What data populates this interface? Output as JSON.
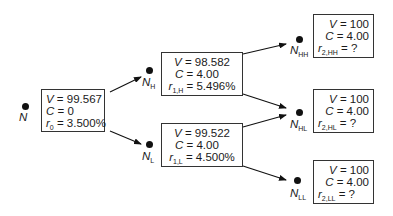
{
  "diagram": {
    "type": "binomial interest rate tree",
    "nodes": {
      "root": {
        "label": "N",
        "sub": "",
        "V": "99.567",
        "C": "0",
        "r_sym": "r",
        "r_sub": "0",
        "r": "3.500%"
      },
      "H": {
        "label": "N",
        "sub": "H",
        "V": "98.582",
        "C": "4.00",
        "r_sym": "r",
        "r_sub": "1,H",
        "r": "5.496%"
      },
      "L": {
        "label": "N",
        "sub": "L",
        "V": "99.522",
        "C": "4.00",
        "r_sym": "r",
        "r_sub": "1,L",
        "r": "4.500%"
      },
      "HH": {
        "label": "N",
        "sub": "HH",
        "V": "100",
        "C": "4.00",
        "r_sym": "r",
        "r_sub": "2,HH",
        "r": "?"
      },
      "HL": {
        "label": "N",
        "sub": "HL",
        "V": "100",
        "C": "4.00",
        "r_sym": "r",
        "r_sub": "2,HL",
        "r": "?"
      },
      "LL": {
        "label": "N",
        "sub": "LL",
        "V": "100",
        "C": "4.00",
        "r_sym": "r",
        "r_sub": "2,LL",
        "r": "?"
      }
    },
    "symbols": {
      "V": "V",
      "C": "C",
      "eq": " = "
    },
    "edges": [
      {
        "from": "root",
        "to": "H"
      },
      {
        "from": "root",
        "to": "L"
      },
      {
        "from": "H",
        "to": "HH"
      },
      {
        "from": "H",
        "to": "HL"
      },
      {
        "from": "L",
        "to": "HL"
      },
      {
        "from": "L",
        "to": "LL"
      }
    ]
  }
}
